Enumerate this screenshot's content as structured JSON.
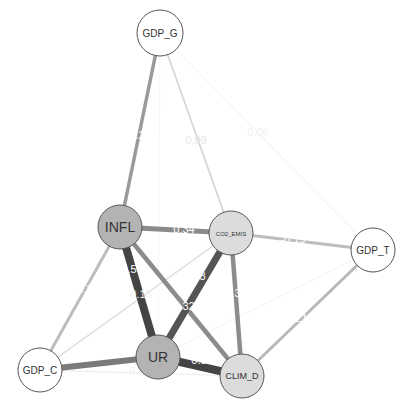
{
  "diagram": {
    "type": "network-graph",
    "nodes": [
      {
        "id": "GDP_G",
        "label": "GDP_G",
        "x": 160,
        "y": 33,
        "r": 23,
        "fill": "#ffffff",
        "font_size": 10
      },
      {
        "id": "INFL",
        "label": "INFL",
        "x": 120,
        "y": 227,
        "r": 22,
        "fill": "#b3b3b3",
        "font_size": 14
      },
      {
        "id": "CO2_EMIS",
        "label": "CO2_EMIS",
        "x": 231,
        "y": 233,
        "r": 22,
        "fill": "#dcdcdc",
        "font_size": 6
      },
      {
        "id": "GDP_T",
        "label": "GDP_T",
        "x": 373,
        "y": 250,
        "r": 22,
        "fill": "#ffffff",
        "font_size": 10
      },
      {
        "id": "GDP_C",
        "label": "GDP_C",
        "x": 40,
        "y": 370,
        "r": 22,
        "fill": "#ffffff",
        "font_size": 10
      },
      {
        "id": "UR",
        "label": "UR",
        "x": 158,
        "y": 357,
        "r": 22,
        "fill": "#b3b3b3",
        "font_size": 14
      },
      {
        "id": "CLIM_D",
        "label": "CLIM_D",
        "x": 242,
        "y": 376,
        "r": 22,
        "fill": "#dcdcdc",
        "font_size": 9
      }
    ],
    "edges": [
      {
        "source": "GDP_G",
        "target": "INFL",
        "weight": "0.22",
        "width": 3.5,
        "color": "#9a9a9a",
        "lx": 140,
        "ly": 136,
        "lcolor": "#ffffff"
      },
      {
        "source": "GDP_G",
        "target": "CO2_EMIS",
        "weight": "0.09",
        "width": 1.8,
        "color": "#d6d6d6",
        "lx": 196,
        "ly": 141,
        "lcolor": "#e6e6e6"
      },
      {
        "source": "GDP_G",
        "target": "GDP_T",
        "weight": "0.06",
        "width": 0.8,
        "color": "#ececec",
        "lx": 258,
        "ly": 133,
        "lcolor": "#f0f0f0"
      },
      {
        "source": "GDP_G",
        "target": "UR",
        "weight": "",
        "width": 0.6,
        "color": "#f2f2f2",
        "lx": 0,
        "ly": 0,
        "lcolor": "#f4f4f4"
      },
      {
        "source": "INFL",
        "target": "CO2_EMIS",
        "weight": "0.34",
        "width": 5,
        "color": "#8a8a8a",
        "lx": 184,
        "ly": 230,
        "lcolor": "#ffffff"
      },
      {
        "source": "INFL",
        "target": "UR",
        "weight": "0.56",
        "width": 8,
        "color": "#444444",
        "lx": 132,
        "ly": 270,
        "lcolor": "#ffffff"
      },
      {
        "source": "INFL",
        "target": "CLIM_D",
        "weight": "0.32",
        "width": 4.5,
        "color": "#8c8c8c",
        "lx": 184,
        "ly": 307,
        "lcolor": "#ffffff"
      },
      {
        "source": "INFL",
        "target": "GDP_C",
        "weight": "-0.2",
        "width": 3,
        "color": "#bdbdbd",
        "lx": 83,
        "ly": 290,
        "lcolor": "#ffffff"
      },
      {
        "source": "CO2_EMIS",
        "target": "UR",
        "weight": "0.48",
        "width": 7,
        "color": "#555555",
        "lx": 195,
        "ly": 277,
        "lcolor": "#ffffff"
      },
      {
        "source": "CO2_EMIS",
        "target": "CLIM_D",
        "weight": "0.32",
        "width": 4.5,
        "color": "#8c8c8c",
        "lx": 236,
        "ly": 294,
        "lcolor": "#ffffff"
      },
      {
        "source": "CO2_EMIS",
        "target": "GDP_T",
        "weight": "-0.19",
        "width": 3,
        "color": "#bdbdbd",
        "lx": 293,
        "ly": 240,
        "lcolor": "#ffffff"
      },
      {
        "source": "CO2_EMIS",
        "target": "GDP_C",
        "weight": "0.15",
        "width": 1.5,
        "color": "#dcdcdc",
        "lx": 141,
        "ly": 295,
        "lcolor": "#f2f2f2"
      },
      {
        "source": "GDP_T",
        "target": "CLIM_D",
        "weight": "0.21",
        "width": 3,
        "color": "#b8b8b8",
        "lx": 297,
        "ly": 319,
        "lcolor": "#ffffff"
      },
      {
        "source": "GDP_T",
        "target": "UR",
        "weight": "",
        "width": 0.8,
        "color": "#efefef",
        "lx": 0,
        "ly": 0,
        "lcolor": "#f4f4f4"
      },
      {
        "source": "GDP_C",
        "target": "UR",
        "weight": "-0.41",
        "width": 6,
        "color": "#7a7a7a",
        "lx": 100,
        "ly": 350,
        "lcolor": "#ffffff"
      },
      {
        "source": "GDP_C",
        "target": "CLIM_D",
        "weight": "0.06",
        "width": 1,
        "color": "#ececec",
        "lx": 140,
        "ly": 372,
        "lcolor": "#f0f0f0"
      },
      {
        "source": "UR",
        "target": "CLIM_D",
        "weight": "0.59",
        "width": 8,
        "color": "#444444",
        "lx": 202,
        "ly": 361,
        "lcolor": "#ffffff"
      }
    ]
  }
}
